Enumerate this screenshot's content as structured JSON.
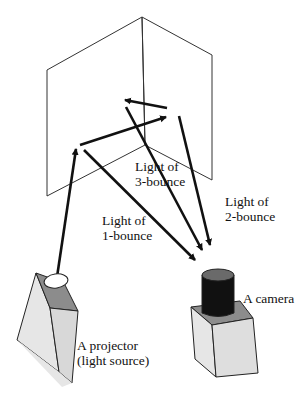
{
  "diagram": {
    "title": "",
    "nodes": {
      "wall": {
        "label": ""
      },
      "projector": {
        "line1": "A projector",
        "line2": "(light source)"
      },
      "camera": {
        "label": "A camera"
      }
    },
    "rays": [
      {
        "id": "1-bounce",
        "line1": "Light of",
        "line2": "1-bounce"
      },
      {
        "id": "2-bounce",
        "line1": "Light of",
        "line2": "2-bounce"
      },
      {
        "id": "3-bounce",
        "line1": "Light of",
        "line2": "3-bounce"
      }
    ]
  },
  "colors": {
    "stroke": "#111111",
    "wall_stroke": "#333333",
    "box_light": "#e6e6e6",
    "box_mid": "#d4d4d4",
    "box_dark": "#8c8c8c",
    "lens_body": "#111111",
    "lens_top": "#6a6a6a",
    "projector_lens": "#ffffff"
  }
}
